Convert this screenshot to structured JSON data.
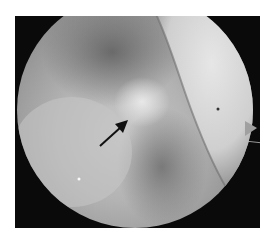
{
  "image": {
    "type": "arthroscopic-view",
    "description": "Grayscale circular arthroscopic/endoscopic view inside a black rectangular frame with a black arrow pointing to a bright tissue region at center",
    "annotation": {
      "type": "arrow",
      "color": "#111111",
      "from": [
        100,
        146
      ],
      "to": [
        127,
        122
      ]
    },
    "colors": {
      "frame": "#0a0a0a",
      "background": "#ffffff",
      "bright_structure": "#d9d9d9",
      "tissue_mid": "#a8a8a8",
      "shadow": "#555555"
    }
  }
}
